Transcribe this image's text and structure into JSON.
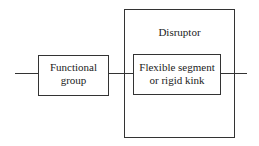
{
  "diagram": {
    "functional_group": {
      "line1": "Functional",
      "line2": "group"
    },
    "disruptor": {
      "title": "Disruptor"
    },
    "inner": {
      "line1": "Flexible segment",
      "line2": "or rigid kink"
    }
  }
}
